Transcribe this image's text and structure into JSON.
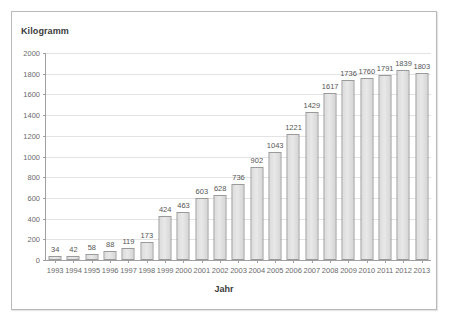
{
  "chart_data": {
    "type": "bar",
    "title": "",
    "ylabel": "Kilogramm",
    "xlabel": "Jahr",
    "ylim": [
      0,
      2000
    ],
    "ytick_step": 200,
    "grid": true,
    "legend": "none",
    "categories": [
      "1993",
      "1994",
      "1995",
      "1996",
      "1997",
      "1998",
      "1999",
      "2000",
      "2001",
      "2002",
      "2003",
      "2004",
      "2005",
      "2006",
      "2007",
      "2008",
      "2009",
      "2010",
      "2011",
      "2012",
      "2013"
    ],
    "values": [
      34,
      42,
      58,
      88,
      119,
      173,
      424,
      463,
      603,
      628,
      736,
      902,
      1043,
      1221,
      1429,
      1617,
      1736,
      1760,
      1791,
      1839,
      1803
    ],
    "ytick_labels": [
      "0",
      "200",
      "400",
      "600",
      "800",
      "1000",
      "1200",
      "1400",
      "1600",
      "1800",
      "2000"
    ],
    "colors": {
      "bar_fill": "#e3e3e3",
      "bar_border": "#9a9a9a",
      "gridline": "#e3e3e3",
      "axis": "#a0a0a0",
      "label_text": "#6b6b6b",
      "title_text": "#3b3b3b",
      "frame_border": "#b9b9b9",
      "background": "#ffffff"
    }
  }
}
